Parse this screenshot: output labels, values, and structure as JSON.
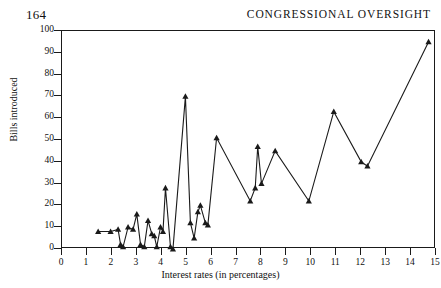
{
  "page": {
    "folio": "164",
    "running_title": "CONGRESSIONAL OVERSIGHT"
  },
  "chart_data": {
    "type": "line",
    "title": "",
    "xlabel": "Interest rates (in percentages)",
    "ylabel": "Bills introduced",
    "xlim": [
      0,
      15
    ],
    "ylim": [
      0,
      100
    ],
    "xticks": [
      0,
      1,
      2,
      3,
      4,
      5,
      6,
      7,
      8,
      9,
      10,
      11,
      12,
      13,
      14,
      15
    ],
    "yticks": [
      0,
      10,
      20,
      30,
      40,
      50,
      60,
      70,
      80,
      90,
      100
    ],
    "grid": false,
    "legend": false,
    "marker": "triangle",
    "line_color": "#1a1a1a",
    "series": [
      {
        "name": "Bills introduced",
        "points": [
          [
            1.45,
            8
          ],
          [
            1.95,
            8
          ],
          [
            2.25,
            9
          ],
          [
            2.35,
            2
          ],
          [
            2.45,
            1
          ],
          [
            2.65,
            10
          ],
          [
            2.85,
            9
          ],
          [
            3.0,
            16
          ],
          [
            3.15,
            2
          ],
          [
            3.3,
            1
          ],
          [
            3.45,
            13
          ],
          [
            3.6,
            7
          ],
          [
            3.7,
            6
          ],
          [
            3.8,
            1
          ],
          [
            3.95,
            10
          ],
          [
            4.05,
            8
          ],
          [
            4.15,
            28
          ],
          [
            4.35,
            1
          ],
          [
            4.45,
            0
          ],
          [
            4.95,
            70
          ],
          [
            5.15,
            12
          ],
          [
            5.3,
            5
          ],
          [
            5.45,
            17
          ],
          [
            5.55,
            20
          ],
          [
            5.75,
            12
          ],
          [
            5.85,
            11
          ],
          [
            6.2,
            51
          ],
          [
            7.55,
            22
          ],
          [
            7.75,
            28
          ],
          [
            7.85,
            47
          ],
          [
            8.0,
            30
          ],
          [
            8.55,
            45
          ],
          [
            9.9,
            22
          ],
          [
            10.9,
            63
          ],
          [
            12.0,
            40
          ],
          [
            12.25,
            38
          ],
          [
            14.7,
            95
          ]
        ]
      }
    ]
  }
}
